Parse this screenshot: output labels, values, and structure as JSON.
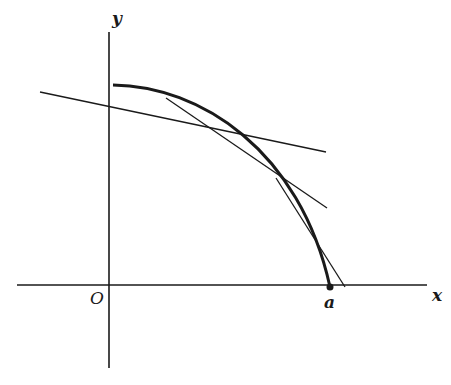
{
  "figure": {
    "type": "diagram",
    "colors": {
      "ink": "#1a1a1a",
      "background": "#ffffff"
    },
    "labels": {
      "x_axis": "x",
      "y_axis": "y",
      "origin": "O",
      "point_a": "a"
    },
    "axes": {
      "x_axis": {
        "x1": 17,
        "y1": 285,
        "x2": 427,
        "y2": 285
      },
      "y_axis": {
        "x1": 109,
        "y1": 32,
        "x2": 109,
        "y2": 368
      }
    },
    "curve": {
      "start": [
        113,
        85
      ],
      "end": [
        330,
        287
      ],
      "path": "M 113 85 C 200 86, 300 150, 330 287"
    },
    "tangent_lines": [
      {
        "name": "tangent-1",
        "x1": 40,
        "y1": 92,
        "x2": 326,
        "y2": 152
      },
      {
        "name": "tangent-2",
        "x1": 166,
        "y1": 98,
        "x2": 327,
        "y2": 208
      },
      {
        "name": "tangent-3",
        "x1": 276,
        "y1": 178,
        "x2": 345,
        "y2": 287
      }
    ],
    "point_a": {
      "cx": 330,
      "cy": 287,
      "r": 3.5
    }
  }
}
